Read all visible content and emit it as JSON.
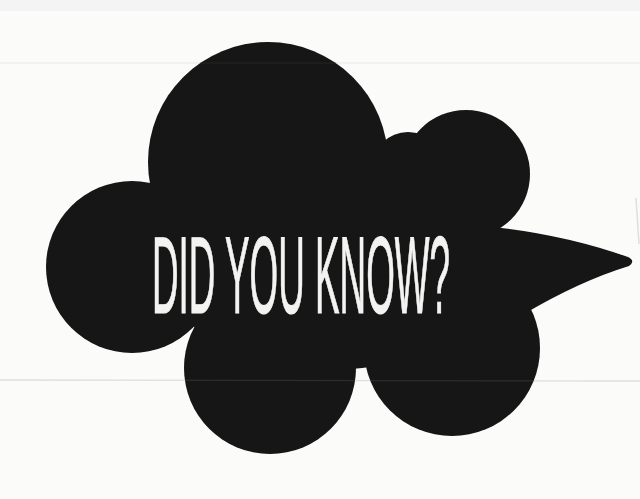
{
  "bubble": {
    "text": "DID YOU KNOW?"
  },
  "colors": {
    "background": "#fbfbfa",
    "bubble_fill": "#141414",
    "text_color": "#f3f3f1",
    "scanline": "#7d7d7d",
    "top_strip": "#efefee",
    "scratch": "#c2c2c2"
  }
}
